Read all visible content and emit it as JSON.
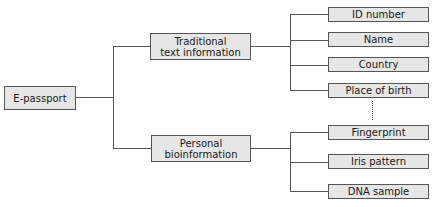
{
  "diagram": {
    "type": "tree",
    "root": {
      "label": "E-passport"
    },
    "branches": [
      {
        "label": "Traditional\ntext information",
        "line1": "Traditional",
        "line2": "text information",
        "children": [
          "ID number",
          "Name",
          "Country",
          "Place of birth"
        ]
      },
      {
        "label": "Personal\nbioinformation",
        "line1": "Personal",
        "line2": "bioinformation",
        "children": [
          "Fingerprint",
          "Iris pattern",
          "DNA sample"
        ]
      }
    ],
    "ellipsis_between_groups": "dotted-vertical-line",
    "colors": {
      "box_fill": "#e6e6e6",
      "box_border": "#555555",
      "line": "#555555"
    }
  }
}
